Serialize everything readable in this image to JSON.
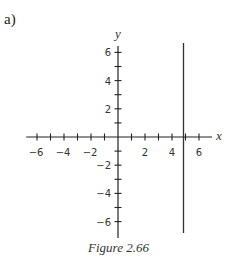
{
  "part_label": "a)",
  "caption": "Figure 2.66",
  "chart_data": {
    "type": "line",
    "title": "",
    "xlabel": "x",
    "ylabel": "y",
    "xlim": [
      -6.5,
      7
    ],
    "ylim": [
      -7,
      6.8
    ],
    "xticks": [
      -6,
      -5,
      -4,
      -3,
      -2,
      -1,
      1,
      2,
      3,
      4,
      5,
      6
    ],
    "xtick_labels": [
      -6,
      -4,
      -2,
      2,
      4,
      6
    ],
    "yticks": [
      -6,
      -5,
      -4,
      -3,
      -2,
      -1,
      1,
      2,
      3,
      4,
      5,
      6
    ],
    "ytick_labels": [
      -6,
      -4,
      -2,
      2,
      4,
      6
    ],
    "grid": false,
    "series": [
      {
        "name": "x = 5",
        "x": [
          5,
          5
        ],
        "y": [
          7,
          -7
        ]
      }
    ]
  }
}
